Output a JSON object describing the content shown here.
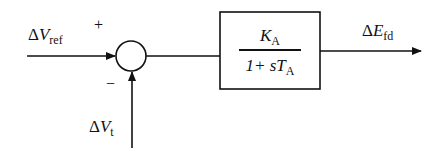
{
  "diagram": {
    "type": "control-block-diagram",
    "inputs": {
      "reference": {
        "delta": "Δ",
        "symbol": "V",
        "subscript": "ref",
        "sign": "+"
      },
      "feedback": {
        "delta": "Δ",
        "symbol": "V",
        "subscript": "t",
        "sign": "−"
      }
    },
    "summing_junction": {
      "type": "circle"
    },
    "transfer_block": {
      "numerator": {
        "symbol": "K",
        "subscript": "A"
      },
      "denominator": {
        "prefix": "1+ s",
        "symbol": "T",
        "subscript": "A"
      }
    },
    "output": {
      "delta": "Δ",
      "symbol": "E",
      "subscript": "fd"
    },
    "colors": {
      "line": "#111111",
      "background": "#ffffff"
    }
  }
}
